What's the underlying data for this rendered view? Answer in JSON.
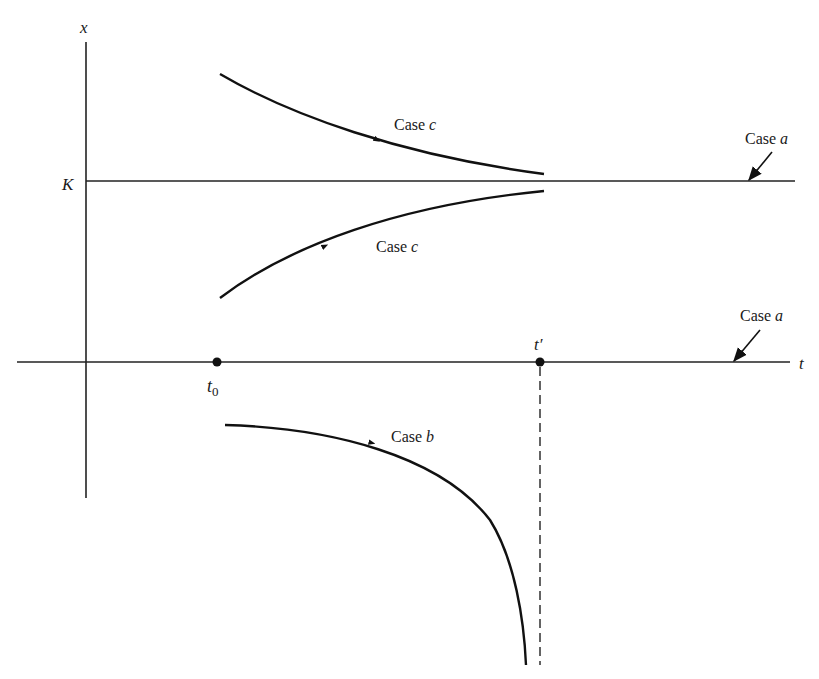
{
  "diagram": {
    "type": "solution-curves",
    "axes": {
      "vertical_label": "x",
      "horizontal_label": "t",
      "level_label": "K"
    },
    "points": {
      "t0": {
        "base": "t",
        "sub": "0"
      },
      "tprime": {
        "text": "t′"
      }
    },
    "curves": [
      {
        "id": "case-c-upper",
        "label_case": "Case ",
        "label_letter": "c",
        "description": "decreasing toward K from above"
      },
      {
        "id": "case-c-lower",
        "label_case": "Case ",
        "label_letter": "c",
        "description": "increasing toward K from below"
      },
      {
        "id": "case-b",
        "label_case": "Case ",
        "label_letter": "b",
        "description": "negative solution diverging to -infinity at t′"
      }
    ],
    "equilibria": [
      {
        "id": "case-a-K",
        "label_case": "Case ",
        "label_letter": "a",
        "level": "K"
      },
      {
        "id": "case-a-zero",
        "label_case": "Case ",
        "label_letter": "a",
        "level": "0"
      }
    ]
  }
}
